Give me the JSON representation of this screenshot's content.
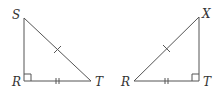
{
  "figure": {
    "stroke_color": "#555555",
    "label_color": "#333333",
    "triangles": [
      {
        "name": "triangle-SRT",
        "vertices": {
          "top": {
            "label": "S",
            "x": 24,
            "y": 18
          },
          "right_angle": {
            "label": "R",
            "x": 24,
            "y": 81
          },
          "acute": {
            "label": "T",
            "x": 91,
            "y": 81
          }
        },
        "right_angle_at": "R",
        "marks": {
          "hypotenuse": "single tick",
          "base": "double tick"
        }
      },
      {
        "name": "triangle-XRT",
        "vertices": {
          "top": {
            "label": "X",
            "x": 199,
            "y": 17
          },
          "acute": {
            "label": "R",
            "x": 134,
            "y": 81
          },
          "right_angle": {
            "label": "T",
            "x": 199,
            "y": 81
          }
        },
        "right_angle_at": "T",
        "marks": {
          "hypotenuse": "single tick",
          "base": "double tick"
        }
      }
    ]
  }
}
